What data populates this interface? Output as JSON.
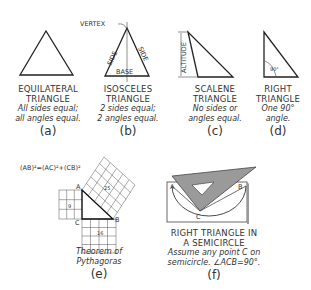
{
  "figures": [
    {
      "id": "a",
      "title": [
        "EQUILATERAL",
        "TRIANGLE"
      ],
      "description": [
        "All sides equal;",
        "all angles equal."
      ],
      "tag": "(a)"
    },
    {
      "id": "b",
      "title": [
        "ISOSCELES",
        "TRIANGLE"
      ],
      "description": [
        "2 sides equal;",
        "2 angles equal."
      ],
      "tag": "(b)",
      "annotations": {
        "vertex": "VERTEX",
        "side_left": "SIDE",
        "side_right": "SIDE",
        "base": "BASE"
      }
    },
    {
      "id": "c",
      "title": [
        "SCALENE",
        "TRIANGLE"
      ],
      "description": [
        "No sides or",
        "angles equal."
      ],
      "tag": "(c)",
      "annotations": {
        "altitude": "ALTITUDE"
      }
    },
    {
      "id": "d",
      "title": [
        "RIGHT",
        "TRIANGLE"
      ],
      "description": [
        "One 90°",
        "angle."
      ],
      "tag": "(d)",
      "annotations": {
        "angle": "90°"
      }
    },
    {
      "id": "e",
      "title": [],
      "description": [
        "Theorem of",
        "Pythagoras"
      ],
      "tag": "(e)",
      "annotations": {
        "formula": "(AB)²=(AC)²+(CB)²",
        "point_a": "A",
        "point_b": "B",
        "point_c": "C",
        "square_ac": "9",
        "square_cb": "16",
        "square_ab": "25"
      }
    },
    {
      "id": "f",
      "title": [
        "RIGHT TRIANGLE IN",
        "A SEMICIRCLE"
      ],
      "description": [
        "Assume any point C on",
        "semicircle. ∠ACB=90°."
      ],
      "tag": "(f)",
      "annotations": {
        "point_a": "A",
        "point_b": "B",
        "point_c": "C"
      }
    }
  ],
  "colors": {
    "line": "#222222",
    "triangle_fill": "#9a9a9a",
    "grid": "#555555"
  }
}
